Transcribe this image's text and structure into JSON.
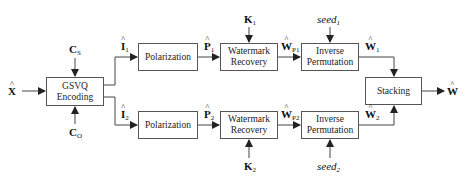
{
  "diagram": {
    "blocks": {
      "gsvq": {
        "line1": "GSVQ",
        "line2": "Encoding"
      },
      "pol1": {
        "label": "Polarization"
      },
      "pol2": {
        "label": "Polarization"
      },
      "wm1": {
        "line1": "Watermark",
        "line2": "Recovery"
      },
      "wm2": {
        "line1": "Watermark",
        "line2": "Recovery"
      },
      "ip1": {
        "line1": "Inverse",
        "line2": "Permutation"
      },
      "ip2": {
        "line1": "Inverse",
        "line2": "Permutation"
      },
      "stack": {
        "label": "Stacking"
      }
    },
    "signals": {
      "x_hat": {
        "base": "X",
        "sub": ""
      },
      "cs": {
        "base": "C",
        "sub": "S"
      },
      "co": {
        "base": "C",
        "sub": "O"
      },
      "i1": {
        "base": "I",
        "sub": "1"
      },
      "i2": {
        "base": "I",
        "sub": "2"
      },
      "p1": {
        "base": "P",
        "sub": "1"
      },
      "p2": {
        "base": "P",
        "sub": "2"
      },
      "k1": {
        "base": "K",
        "sub": "1"
      },
      "k2": {
        "base": "K",
        "sub": "2"
      },
      "wp1": {
        "base": "W",
        "sub": "P1"
      },
      "wp2": {
        "base": "W",
        "sub": "P2"
      },
      "seed1": {
        "base": "seed",
        "sub": "1"
      },
      "seed2": {
        "base": "seed",
        "sub": "2"
      },
      "w1": {
        "base": "W",
        "sub": "1"
      },
      "w2": {
        "base": "W",
        "sub": "2"
      },
      "w_hat": {
        "base": "W",
        "sub": ""
      }
    }
  }
}
